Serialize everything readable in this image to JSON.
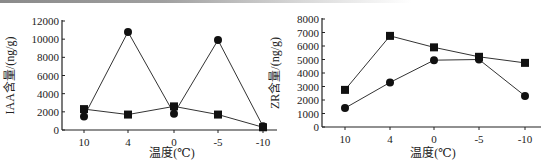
{
  "chart_data": [
    {
      "type": "line",
      "title": "",
      "xlabel": "温度(℃)",
      "ylabel": "IAA含量/(ng/g)",
      "categories": [
        "10",
        "4",
        "0",
        "-5",
        "-10"
      ],
      "ylim": [
        0,
        12000
      ],
      "yticks": [
        0,
        2000,
        4000,
        6000,
        8000,
        10000,
        12000
      ],
      "grid": false,
      "legend": null,
      "series": [
        {
          "name": "circle-series",
          "marker": "circle",
          "values": [
            1500,
            10800,
            1800,
            9900,
            400
          ]
        },
        {
          "name": "square-series",
          "marker": "square",
          "values": [
            2300,
            1700,
            2600,
            1700,
            300
          ]
        }
      ]
    },
    {
      "type": "line",
      "title": "",
      "xlabel": "温度(℃)",
      "ylabel": "ZR含量/(ng/g)",
      "categories": [
        "10",
        "4",
        "0",
        "-5",
        "-10"
      ],
      "ylim": [
        0,
        8000
      ],
      "yticks": [
        0,
        1000,
        2000,
        3000,
        4000,
        5000,
        6000,
        7000,
        8000
      ],
      "grid": false,
      "legend": null,
      "series": [
        {
          "name": "circle-series",
          "marker": "circle",
          "values": [
            1400,
            3300,
            4950,
            5000,
            2300
          ]
        },
        {
          "name": "square-series",
          "marker": "square",
          "values": [
            2750,
            6750,
            5900,
            5200,
            4750
          ]
        }
      ]
    }
  ],
  "colors": {
    "line": "#333333",
    "marker": "#111111",
    "axis": "#222222"
  }
}
